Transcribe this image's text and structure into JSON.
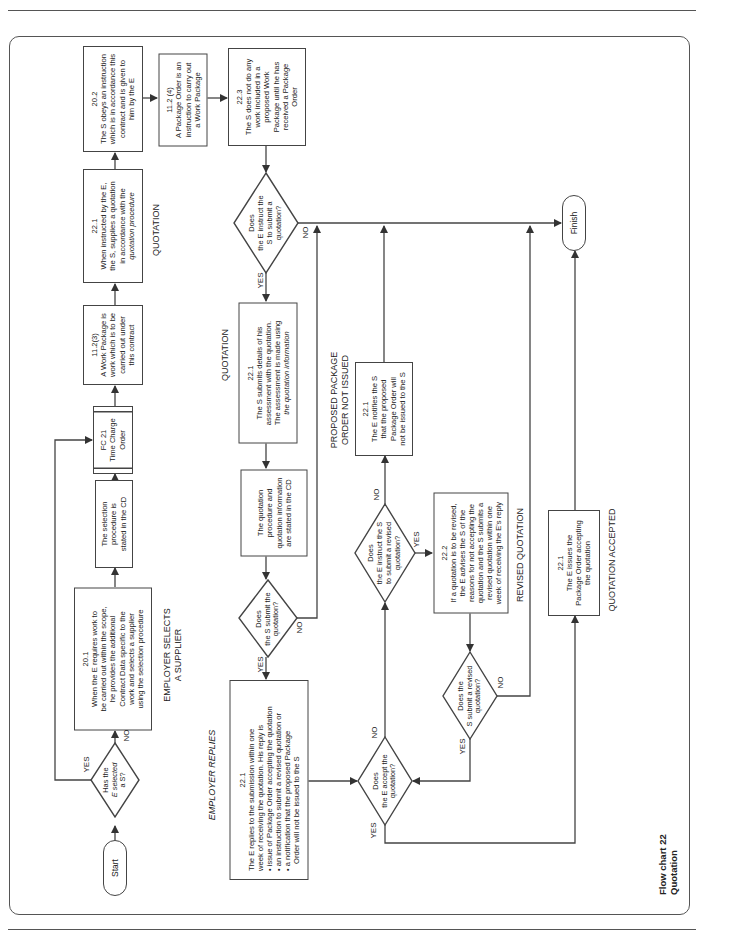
{
  "page": {
    "orientation": "rotated 90 degrees counter-clockwise",
    "figure_title": [
      "Flow chart 22",
      "Quotation"
    ]
  },
  "terminals": {
    "start": "Start",
    "finish": "Finish"
  },
  "sections": {
    "employer_selects": [
      "EMPLOYER SELECTS",
      "A SUPPLIER"
    ],
    "quotation_top": "QUOTATION",
    "quotation_mid": "QUOTATION",
    "employer_replies": "EMPLOYER REPLIES",
    "proposed_not_issued": [
      "PROPOSED PACKAGE",
      "ORDER NOT ISSUED"
    ],
    "revised_quotation": "REVISED QUOTATION",
    "quotation_accepted": "QUOTATION ACCEPTED"
  },
  "decisions": {
    "has_selected": [
      "Has the",
      "E selected",
      "a S?"
    ],
    "instruct_submit": [
      "Does",
      "the E instruct the",
      "S to submit a",
      "quotation?"
    ],
    "s_submit": [
      "Does",
      "the S submit the",
      "quotation?"
    ],
    "e_accept": [
      "Does",
      "the E accept the",
      "quotation?"
    ],
    "instruct_revised": [
      "Does",
      "the E instruct the S",
      "to submit a revised",
      "quotation?"
    ],
    "s_submit_revised": [
      "Does the",
      "S submit a revised",
      "quotation?"
    ]
  },
  "branch_labels": {
    "yes": "YES",
    "no": "NO"
  },
  "boxes": {
    "b20_1": {
      "ref": "20.1",
      "lines": [
        "When the E requires work to",
        "be carried out within the scope,",
        "he provides the additional",
        "Contract Data specific to the",
        "work and selects a supplier",
        "using the selection procedure"
      ]
    },
    "selection_proc": {
      "lines": [
        "The selection",
        "procedure is",
        "stated in the CD"
      ]
    },
    "fc21": {
      "lines": [
        "FC 21",
        "Time Charge",
        "Order"
      ]
    },
    "b11_2_3": {
      "ref": "11.2(3)",
      "lines": [
        "A Work Package is",
        "work which is to be",
        "carried out under",
        "this contract"
      ]
    },
    "b22_1_supply": {
      "ref": "22.1",
      "lines": [
        "When instructed by the E,",
        "the S, supplies a quotation",
        "in accordance with the",
        "quotation procedure"
      ]
    },
    "b20_2": {
      "ref": "20.2",
      "lines": [
        "The S obeys an instruction",
        "which is in accordance this",
        "contract and is given to",
        "him by the E"
      ]
    },
    "b11_2_4": {
      "ref": "11.2 (4)",
      "lines": [
        "A Package Order is an",
        "instruction to carry out",
        "a Work Package"
      ]
    },
    "b22_3": {
      "ref": "22.3",
      "lines": [
        "The S does not do any",
        "work included in a",
        "proposed Work",
        "Package until he has",
        "received a Package",
        "Order"
      ]
    },
    "b22_1_assess": {
      "ref": "22.1",
      "lines": [
        "The S submits details of his",
        "assessment with the quotation.",
        "The assessment is made using",
        "the quotation information"
      ]
    },
    "quot_proc": {
      "lines": [
        "The quotation",
        "procedure and",
        "quotation information",
        "are stated in the CD"
      ]
    },
    "b22_1_reply": {
      "ref": "22.1",
      "lines": [
        "The E replies to the submission within one",
        "week of receiving the quotation. His reply is"
      ],
      "bullets": [
        "issue of Package Order accepting the quotation",
        "an instruction to submit a revised quotation or",
        "a notification that the proposed Package",
        "Order will not be issued to the S"
      ]
    },
    "b22_1_notify": {
      "ref": "22.1",
      "lines": [
        "The E notifies the S",
        "that the proposed",
        "Package Order will",
        "not be issued to the S"
      ]
    },
    "b22_2": {
      "ref": "22.2",
      "lines": [
        "If a quotation is to be revised,",
        "the E advises the S of the",
        "reasons for not accepting the",
        "quotation and the S submits a",
        "revised quotation within one",
        "week of receiving the E's reply"
      ]
    },
    "b22_1_issue": {
      "ref": "22.1",
      "lines": [
        "The E issues the",
        "Package Order accepting",
        "the quotation"
      ]
    }
  },
  "colors": {
    "line": "#444444",
    "frame": "#555555",
    "text": "#222222"
  }
}
